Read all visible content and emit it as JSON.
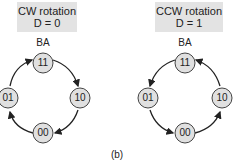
{
  "left": {
    "title_line1": "CW rotation",
    "title_line2": "D = 0",
    "axis_label": "BA",
    "states": [
      "11",
      "10",
      "00",
      "01"
    ],
    "direction": "clockwise"
  },
  "right": {
    "title_line1": "CCW rotation",
    "title_line2": "D = 1",
    "axis_label": "BA",
    "states": [
      "11",
      "01",
      "00",
      "10"
    ],
    "direction": "counterclockwise"
  },
  "caption": "(b)"
}
